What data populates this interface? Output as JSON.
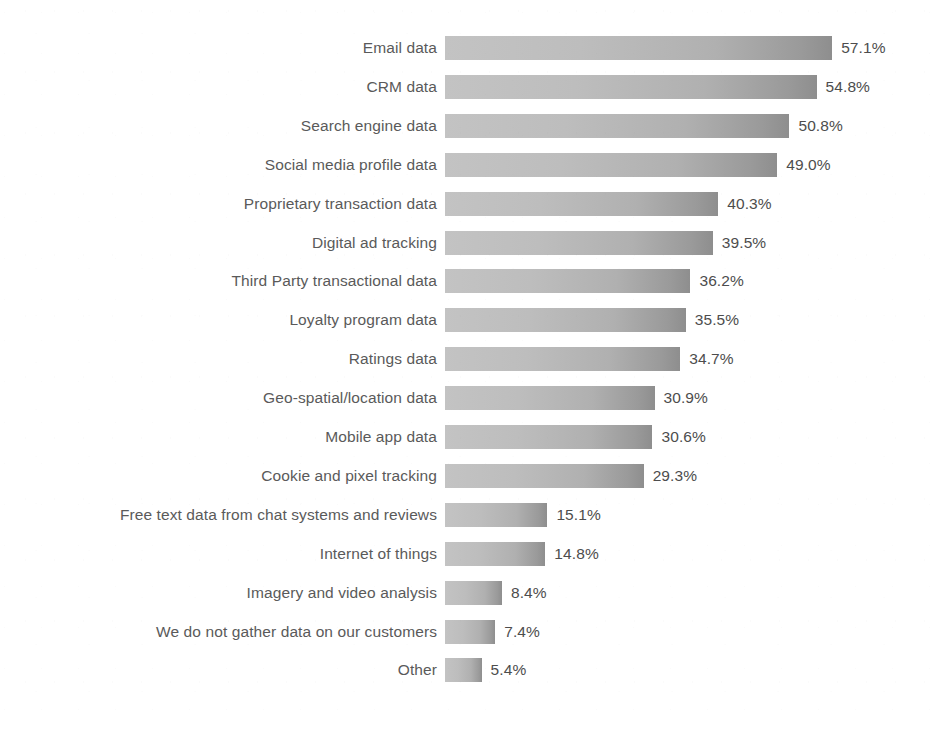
{
  "chart_data": {
    "type": "bar",
    "orientation": "horizontal",
    "title": "",
    "subtitle": "",
    "xlabel": "",
    "ylabel": "",
    "xlim": [
      0,
      60
    ],
    "grid": false,
    "legend": null,
    "value_suffix": "%",
    "value_format": "0.1f",
    "categories": [
      "Email data",
      "CRM data",
      "Search engine data",
      "Social media profile data",
      "Proprietary transaction data",
      "Digital ad tracking",
      "Third Party transactional data",
      "Loyalty program data",
      "Ratings data",
      "Geo-spatial/location data",
      "Mobile app data",
      "Cookie and pixel tracking",
      "Free text data from chat systems and reviews",
      "Internet of things",
      "Imagery and video analysis",
      "We do not gather data on our customers",
      "Other"
    ],
    "values": [
      57.1,
      54.8,
      50.8,
      49.0,
      40.3,
      39.5,
      36.2,
      35.5,
      34.7,
      30.9,
      30.6,
      29.3,
      15.1,
      14.8,
      8.4,
      7.4,
      5.4
    ],
    "value_labels": [
      "57.1%",
      "54.8%",
      "50.8%",
      "49.0%",
      "40.3%",
      "39.5%",
      "36.2%",
      "35.5%",
      "34.7%",
      "30.9%",
      "30.6%",
      "29.3%",
      "15.1%",
      "14.8%",
      "8.4%",
      "7.4%",
      "5.4%"
    ],
    "bar_color_start": "#c3c3c3",
    "bar_color_end": "#8e8e8e",
    "background_color": "#ffffff",
    "label_color": "#5a5a5a"
  },
  "layout": {
    "bar_origin_x": 445,
    "first_bar_top": 36,
    "row_pitch": 38.9,
    "bar_height": 24,
    "px_per_percent": 6.78,
    "label_right_edge": 437
  }
}
